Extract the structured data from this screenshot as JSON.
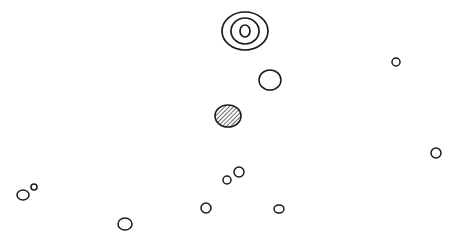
{
  "diagram": {
    "background": "#ffffff",
    "stroke": "#1a1a1a",
    "concentric": {
      "cx": 245,
      "cy": 31,
      "rings": [
        [
          23,
          19
        ],
        [
          14,
          13
        ],
        [
          5,
          6
        ]
      ]
    },
    "hatched": {
      "cx": 228,
      "cy": 116,
      "rx": 13,
      "ry": 11
    },
    "circles": [
      {
        "cx": 270,
        "cy": 80,
        "rx": 11,
        "ry": 10
      },
      {
        "cx": 396,
        "cy": 62,
        "rx": 4,
        "ry": 4
      },
      {
        "cx": 436,
        "cy": 153,
        "rx": 5,
        "ry": 5
      },
      {
        "cx": 23,
        "cy": 195,
        "rx": 6,
        "ry": 5
      },
      {
        "cx": 34,
        "cy": 187,
        "rx": 3,
        "ry": 3
      },
      {
        "cx": 125,
        "cy": 224,
        "rx": 7,
        "ry": 6
      },
      {
        "cx": 206,
        "cy": 208,
        "rx": 5,
        "ry": 5
      },
      {
        "cx": 227,
        "cy": 180,
        "rx": 4,
        "ry": 4
      },
      {
        "cx": 239,
        "cy": 172,
        "rx": 5,
        "ry": 5
      },
      {
        "cx": 279,
        "cy": 209,
        "rx": 5,
        "ry": 4
      }
    ]
  }
}
